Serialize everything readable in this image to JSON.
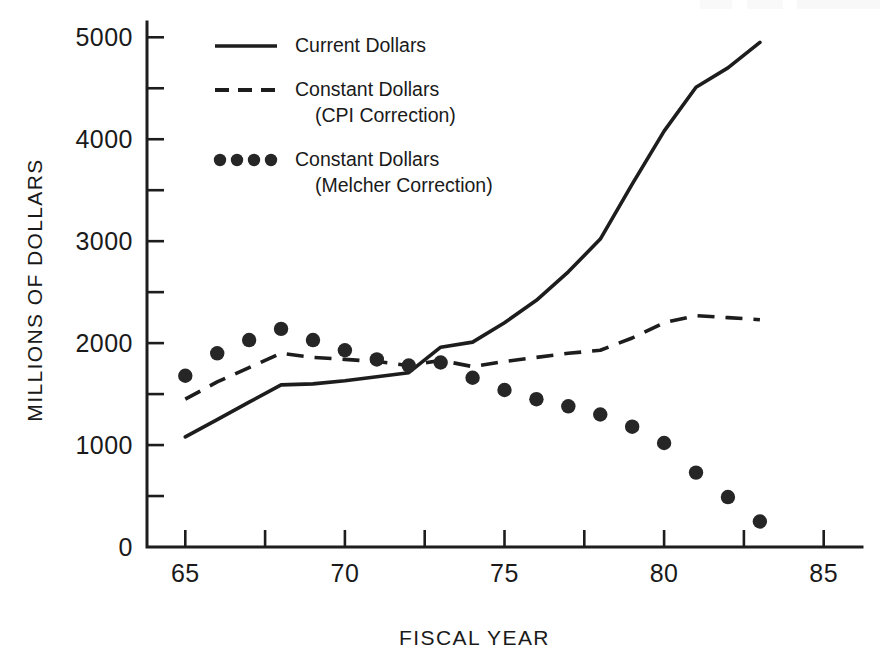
{
  "chart_data": {
    "type": "line",
    "title": "",
    "xlabel": "FISCAL YEAR",
    "ylabel": "MILLIONS OF DOLLARS",
    "xlim": [
      63.8,
      86.2
    ],
    "ylim": [
      0,
      5150
    ],
    "grid": false,
    "legend_position": "upper-left-inside",
    "x_ticks_major": [
      65,
      70,
      75,
      80,
      85
    ],
    "x_tick_labels": [
      "65",
      "70",
      "75",
      "80",
      "85"
    ],
    "x_ticks_minor": [
      67.5,
      72.5,
      77.5,
      82.5
    ],
    "y_ticks_major": [
      0,
      1000,
      2000,
      3000,
      4000,
      5000
    ],
    "y_tick_labels": [
      "0",
      "1000",
      "2000",
      "3000",
      "4000",
      "5000"
    ],
    "y_ticks_minor": [
      500,
      1500,
      2500,
      3500,
      4500
    ],
    "x": [
      65,
      66,
      67,
      68,
      69,
      70,
      71,
      72,
      73,
      74,
      75,
      76,
      77,
      78,
      79,
      80,
      81,
      82,
      83
    ],
    "series": [
      {
        "name": "Current Dollars",
        "style": "solid",
        "values": [
          1080,
          1250,
          1420,
          1590,
          1600,
          1630,
          1670,
          1710,
          1960,
          2010,
          2200,
          2420,
          2700,
          3020,
          3560,
          4080,
          4510,
          4700,
          4950
        ]
      },
      {
        "name": "Constant Dollars (CPI Correction)",
        "style": "dashed",
        "values": [
          1450,
          1620,
          1760,
          1900,
          1860,
          1840,
          1820,
          1780,
          1830,
          1770,
          1820,
          1860,
          1900,
          1930,
          2050,
          2200,
          2270,
          2250,
          2230
        ]
      },
      {
        "name": "Constant Dollars (Melcher Correction)",
        "style": "dots",
        "values": [
          1680,
          1900,
          2030,
          2140,
          2030,
          1930,
          1840,
          1780,
          1810,
          1660,
          1540,
          1450,
          1380,
          1300,
          1180,
          1020,
          730,
          490,
          250
        ]
      }
    ]
  },
  "legend": {
    "entries": [
      {
        "label_line1": "Current Dollars",
        "label_line2": "",
        "style": "solid"
      },
      {
        "label_line1": "Constant Dollars",
        "label_line2": "(CPI Correction)",
        "style": "dashed"
      },
      {
        "label_line1": "Constant Dollars",
        "label_line2": "(Melcher Correction)",
        "style": "dots"
      }
    ]
  },
  "colors": {
    "ink": "#1d1d1d",
    "background": "#ffffff"
  }
}
